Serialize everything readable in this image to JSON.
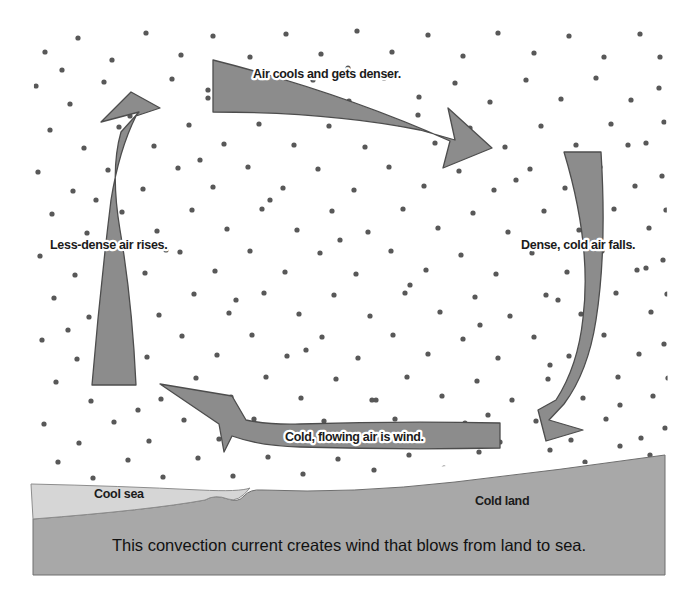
{
  "diagram": {
    "caption": "This convection current creates wind that blows from land to sea.",
    "arrows": [
      {
        "id": "top",
        "label": "Air cools and gets denser.",
        "direction": "right"
      },
      {
        "id": "left",
        "label": "Less-dense air rises.",
        "direction": "up"
      },
      {
        "id": "right",
        "label": "Dense, cold air falls.",
        "direction": "down"
      },
      {
        "id": "bottom",
        "label": "Cold, flowing air is wind.",
        "direction": "left"
      }
    ],
    "ground": {
      "sea_label": "Cool sea",
      "land_label": "Cold land"
    },
    "colors": {
      "arrow_fill": "#8c8c8c",
      "arrow_stroke": "#4d4d4d",
      "land_fill": "#a8a8a8",
      "sea_fill": "#d6d6d6",
      "dot_color": "#585858",
      "background": "#ffffff",
      "text": "#1b1b1b"
    }
  }
}
